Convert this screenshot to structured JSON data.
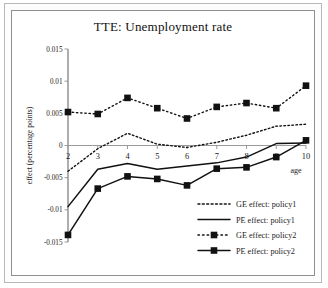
{
  "figure": {
    "title": "TTE: Unemployment rate",
    "frame_color": "#8f8f8f",
    "background": "#ffffff",
    "ink_color": "#111111"
  },
  "axes": {
    "y_title": "effect (percentage points)",
    "x_title": "age",
    "y_ticks": [
      "0.015",
      "0.01",
      "0.005",
      "0",
      "-0.005",
      "-0.01",
      "-0.015"
    ],
    "x_ticks": [
      "2",
      "3",
      "4",
      "5",
      "6",
      "7",
      "8",
      "9",
      "10"
    ]
  },
  "legend": {
    "items": [
      {
        "label": "GE effect: policy1",
        "style": "dotted",
        "marker": "none"
      },
      {
        "label": "PE effect: policy1",
        "style": "solid",
        "marker": "none"
      },
      {
        "label": "GE effect: policy2",
        "style": "dotted",
        "marker": "square"
      },
      {
        "label": "PE effect: policy2",
        "style": "solid",
        "marker": "square"
      }
    ]
  },
  "chart_data": {
    "type": "line",
    "title": "TTE: Unemployment rate",
    "xlabel": "age",
    "ylabel": "effect (percentage points)",
    "x": [
      2,
      3,
      4,
      5,
      6,
      7,
      8,
      9,
      10
    ],
    "xlim": [
      2,
      10
    ],
    "ylim": [
      -0.015,
      0.015
    ],
    "grid": false,
    "legend_position": "lower right",
    "series": [
      {
        "name": "GE effect: policy1",
        "style": "dotted",
        "marker": "none",
        "values": [
          -0.004,
          -0.0005,
          0.0019,
          0.0002,
          -0.0003,
          0.0005,
          0.0016,
          0.003,
          0.0033
        ]
      },
      {
        "name": "PE effect: policy1",
        "style": "solid",
        "marker": "none",
        "values": [
          -0.0095,
          -0.0037,
          -0.0028,
          -0.0037,
          -0.0032,
          -0.0027,
          -0.0018,
          0.0003,
          0.0004
        ]
      },
      {
        "name": "GE effect: policy2",
        "style": "dotted",
        "marker": "square",
        "values": [
          0.0052,
          0.0049,
          0.0074,
          0.0058,
          0.0042,
          0.006,
          0.0066,
          0.0058,
          0.0093
        ]
      },
      {
        "name": "PE effect: policy2",
        "style": "solid",
        "marker": "square",
        "values": [
          -0.0139,
          -0.0067,
          -0.0048,
          -0.0052,
          -0.0062,
          -0.0036,
          -0.0034,
          -0.0018,
          0.0008
        ]
      }
    ]
  }
}
